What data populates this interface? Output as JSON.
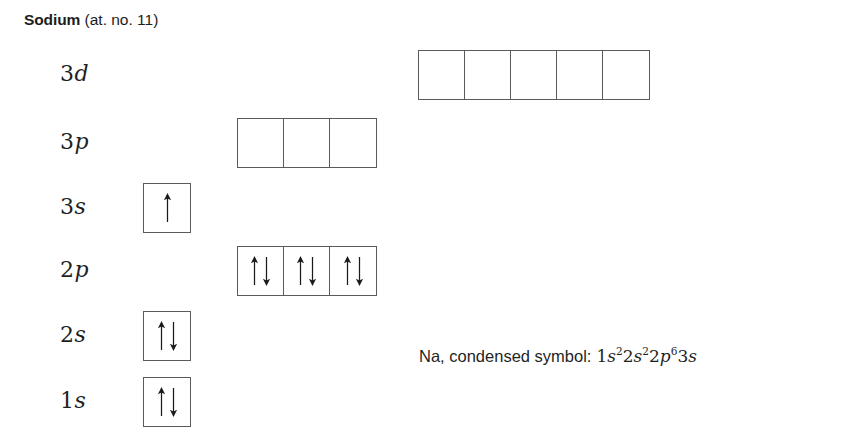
{
  "title": {
    "element_name": "Sodium",
    "atomic_note": "(at. no. 11)"
  },
  "diagram": {
    "type": "orbital-box-diagram",
    "element_symbol": "Na",
    "atomic_number": 11,
    "rows": [
      {
        "id": "3d",
        "label_n": "3",
        "label_l": "d",
        "box_count": 5,
        "boxes": [
          "",
          "",
          "",
          "",
          ""
        ],
        "electrons": 0,
        "left": 418,
        "top": 50
      },
      {
        "id": "3p",
        "label_n": "3",
        "label_l": "p",
        "box_count": 3,
        "boxes": [
          "",
          "",
          ""
        ],
        "electrons": 0,
        "left": 237,
        "top": 118
      },
      {
        "id": "3s",
        "label_n": "3",
        "label_l": "s",
        "box_count": 1,
        "boxes": [
          "up"
        ],
        "electrons": 1,
        "left": 143,
        "top": 183
      },
      {
        "id": "2p",
        "label_n": "2",
        "label_l": "p",
        "box_count": 3,
        "boxes": [
          "updown",
          "updown",
          "updown"
        ],
        "electrons": 6,
        "left": 237,
        "top": 246
      },
      {
        "id": "2s",
        "label_n": "2",
        "label_l": "s",
        "box_count": 1,
        "boxes": [
          "updown"
        ],
        "electrons": 2,
        "left": 143,
        "top": 311
      },
      {
        "id": "1s",
        "label_n": "1",
        "label_l": "s",
        "box_count": 1,
        "boxes": [
          "updown"
        ],
        "electrons": 2,
        "left": 143,
        "top": 377
      }
    ],
    "label_left": 60,
    "colors": {
      "box_stroke": "#5a5a5a",
      "arrow": "#1a1a1a",
      "text": "#1f1f1f",
      "background": "#ffffff"
    }
  },
  "condensed_symbol": {
    "lead_text": "Na, condensed symbol:",
    "configuration": [
      {
        "shell": "1",
        "orbital": "s",
        "count": "2"
      },
      {
        "shell": "2",
        "orbital": "s",
        "count": "2"
      },
      {
        "shell": "2",
        "orbital": "p",
        "count": "6"
      },
      {
        "shell": "3",
        "orbital": "s",
        "count": ""
      }
    ],
    "plain_text": "Na, condensed symbol: 1s22s22p63s"
  }
}
